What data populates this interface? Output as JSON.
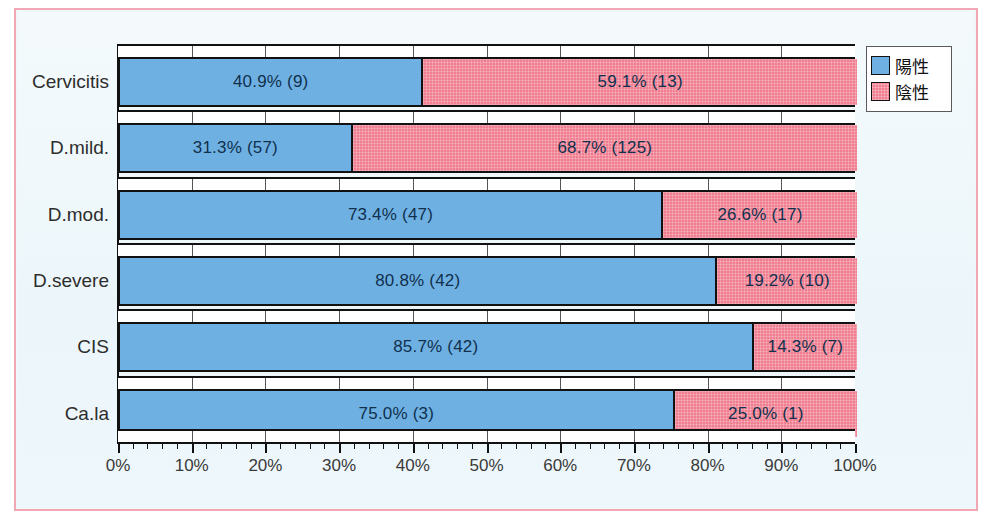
{
  "chart_data": {
    "type": "bar",
    "subtype": "stacked-horizontal-100-percent",
    "title": "",
    "xlabel": "",
    "ylabel": "",
    "xlim": [
      0,
      100
    ],
    "grid": true,
    "legend_position": "top-right",
    "categories": [
      "Cervicitis",
      "D.mild.",
      "D.mod.",
      "D.severe",
      "CIS",
      "Ca.la"
    ],
    "x_tick_labels": [
      "0%",
      "10%",
      "20%",
      "30%",
      "40%",
      "50%",
      "60%",
      "70%",
      "80%",
      "90%",
      "100%"
    ],
    "x_tick_values": [
      0,
      10,
      20,
      30,
      40,
      50,
      60,
      70,
      80,
      90,
      100
    ],
    "series": [
      {
        "name": "陽性",
        "color": "#6fb0e2",
        "values": [
          40.9,
          31.3,
          73.4,
          80.8,
          85.7,
          75.0
        ],
        "counts": [
          9,
          57,
          47,
          42,
          42,
          3
        ],
        "labels": [
          "40.9% (9)",
          "31.3% (57)",
          "73.4% (47)",
          "80.8% (42)",
          "85.7% (42)",
          "75.0% (3)"
        ]
      },
      {
        "name": "陰性",
        "color": "#f07e90",
        "values": [
          59.1,
          68.7,
          26.6,
          19.2,
          14.3,
          25.0
        ],
        "counts": [
          13,
          125,
          17,
          10,
          7,
          1
        ],
        "labels": [
          "59.1% (13)",
          "68.7% (125)",
          "26.6% (17)",
          "19.2% (10)",
          "14.3% (7)",
          "25.0% (1)"
        ]
      }
    ]
  },
  "legend": {
    "items": [
      {
        "label": "陽性",
        "swatch": "positive-swatch"
      },
      {
        "label": "陰性",
        "swatch": "negative-swatch"
      }
    ]
  },
  "colors": {
    "positive": "#6fb0e2",
    "negative": "#f07e90",
    "frame": "#f2a7b4",
    "background": "#eff7fa",
    "bar_outline": "#111111",
    "label_text": "#10304e"
  }
}
